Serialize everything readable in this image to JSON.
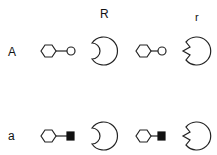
{
  "column_labels": {
    "R": "R",
    "r": "r"
  },
  "row_labels": {
    "A": "A",
    "a": "a"
  },
  "icons": {
    "ligand": "hexagon-with-tail",
    "ligand_A_end": "open-circle",
    "ligand_a_end": "filled-square",
    "receptor_R": "circle-with-rounded-notch",
    "receptor_r": "circle-with-v-notch"
  },
  "colors": {
    "stroke": "#222222",
    "fill_square": "#111111",
    "background": "#ffffff"
  }
}
